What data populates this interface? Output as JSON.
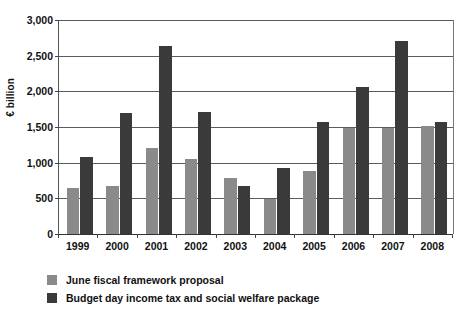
{
  "chart_data": {
    "type": "bar",
    "title": "",
    "subtitle": "",
    "xlabel": "",
    "ylabel": "€ billion",
    "ylim": [
      0,
      3000
    ],
    "ytick_step": 500,
    "ytick_labels": [
      "0",
      "500",
      "1,000",
      "1,500",
      "2,000",
      "2,500",
      "3,000"
    ],
    "grid": true,
    "grid_axis": "y",
    "legend_position": "below-left",
    "categories": [
      "1999",
      "2000",
      "2001",
      "2002",
      "2003",
      "2004",
      "2005",
      "2006",
      "2007",
      "2008"
    ],
    "series": [
      {
        "name": "June fiscal framework proposal",
        "color": "#8a8a8a",
        "values": [
          640,
          670,
          1210,
          1050,
          780,
          490,
          890,
          1490,
          1490,
          1510
        ]
      },
      {
        "name": "Budget day income tax and social welfare package",
        "color": "#3a3a3a",
        "values": [
          1085,
          1700,
          2640,
          1710,
          680,
          920,
          1575,
          2055,
          2710,
          1570
        ]
      }
    ]
  },
  "legend": {
    "items": [
      {
        "label": "June fiscal framework proposal",
        "color": "#8a8a8a"
      },
      {
        "label": "Budget day income tax and social welfare package",
        "color": "#3a3a3a"
      }
    ]
  },
  "axes": {
    "y_title": "€ billion"
  }
}
